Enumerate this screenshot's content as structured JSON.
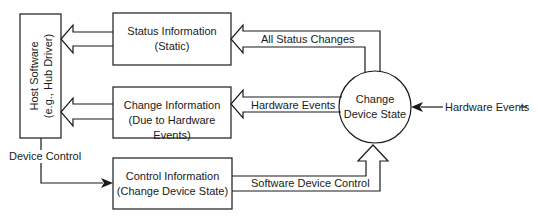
{
  "diagram": {
    "type": "data-flow",
    "nodes": {
      "host": {
        "line1": "Host Software",
        "line2": "(e.g., Hub Driver)"
      },
      "status": {
        "line1": "Status Information",
        "line2": "(Static)"
      },
      "change": {
        "line1": "Change Information",
        "line2": "(Due to Hardware Events)"
      },
      "control": {
        "line1": "Control Information",
        "line2": "(Change Device State)"
      },
      "state": {
        "line1": "Change",
        "line2": "Device State"
      }
    },
    "edges": {
      "all_status_changes": "All Status Changes",
      "hardware_events_internal": "Hardware Events",
      "software_device_control": "Software Device Control",
      "device_control": "Device Control",
      "hardware_events_external": "Hardware Events"
    },
    "colors": {
      "stroke": "#1a1a1a",
      "background": "#ffffff"
    }
  }
}
